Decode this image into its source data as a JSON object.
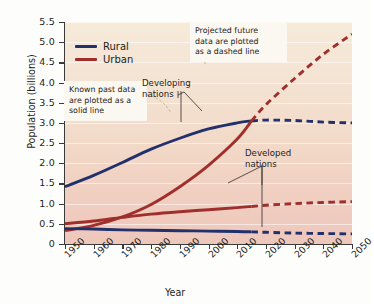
{
  "chart_data": {
    "type": "line",
    "title": "",
    "xlabel": "Year",
    "ylabel": "Population (billions)",
    "xlim": [
      1950,
      2050
    ],
    "ylim": [
      0,
      5.5
    ],
    "grid": true,
    "legend_position": "top-left-inside",
    "x_ticks": [
      "1950",
      "1960",
      "1970",
      "1980",
      "1990",
      "2000",
      "2010",
      "2020",
      "2030",
      "2040",
      "2050"
    ],
    "y_ticks": [
      "0",
      "0.5",
      "1.0",
      "1.5",
      "2.0",
      "2.5",
      "3.0",
      "3.5",
      "4.0",
      "4.5",
      "5.0",
      "5.5"
    ],
    "solid_dashed_split_year": 2015,
    "colors": {
      "rural": "#22306b",
      "urban": "#a02f2c",
      "plot_background_top": "#f6ead9",
      "plot_background_bottom": "#eec7bb"
    },
    "legend": [
      {
        "name": "Rural",
        "color": "#22306b"
      },
      {
        "name": "Urban",
        "color": "#a02f2c"
      }
    ],
    "x": [
      1950,
      1960,
      1970,
      1980,
      1990,
      2000,
      2010,
      2015,
      2020,
      2030,
      2040,
      2050
    ],
    "series": [
      {
        "name": "Rural, developing nations",
        "legend_group": "Rural",
        "group": "Developing nations",
        "color": "#22306b",
        "values": [
          1.42,
          1.7,
          2.02,
          2.35,
          2.62,
          2.85,
          3.0,
          3.05,
          3.07,
          3.06,
          3.02,
          3.0
        ]
      },
      {
        "name": "Urban, developing nations",
        "legend_group": "Urban",
        "group": "Developing nations",
        "color": "#a02f2c",
        "values": [
          0.33,
          0.46,
          0.67,
          0.98,
          1.42,
          1.95,
          2.6,
          3.05,
          3.45,
          4.1,
          4.7,
          5.2
        ]
      },
      {
        "name": "Urban, developed nations",
        "legend_group": "Urban",
        "group": "Developed nations",
        "color": "#a02f2c",
        "values": [
          0.5,
          0.57,
          0.66,
          0.74,
          0.8,
          0.85,
          0.9,
          0.93,
          0.96,
          1.0,
          1.03,
          1.05
        ]
      },
      {
        "name": "Rural, developed nations",
        "legend_group": "Rural",
        "group": "Developed nations",
        "color": "#22306b",
        "values": [
          0.38,
          0.37,
          0.35,
          0.34,
          0.33,
          0.32,
          0.31,
          0.3,
          0.29,
          0.27,
          0.26,
          0.25
        ]
      }
    ],
    "annotations": [
      {
        "id": "known-past",
        "text": "Known past data are plotted as a solid line",
        "style": "callout-box"
      },
      {
        "id": "projected-future",
        "text": "Projected future data are plotted as a dashed line",
        "style": "callout-box"
      },
      {
        "id": "developing-nations",
        "text": "Developing nations",
        "style": "plain-label"
      },
      {
        "id": "developed-nations",
        "text": "Developed nations",
        "style": "plain-label"
      }
    ]
  },
  "annotations": {
    "known_past_line1": "Known past data",
    "known_past_line2": "are plotted as a",
    "known_past_line3": "solid line",
    "projected_line1": "Projected future",
    "projected_line2": "data are plotted",
    "projected_line3": "as a dashed line",
    "developing_line1": "Developing",
    "developing_line2": "nations",
    "developed_line1": "Developed",
    "developed_line2": "nations"
  },
  "axes": {
    "ylabel": "Population (billions)",
    "xlabel": "Year"
  },
  "legend": {
    "rural_label": "Rural",
    "urban_label": "Urban"
  }
}
